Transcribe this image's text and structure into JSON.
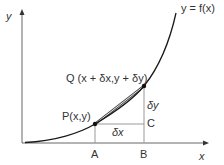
{
  "diagram": {
    "axes": {
      "x_label": "x",
      "y_label": "y"
    },
    "curve_label": "y = f(x)",
    "points": {
      "P": {
        "label": "P(x,y)"
      },
      "Q": {
        "label": "Q (x + δx,y + δy)"
      },
      "A": {
        "label": "A"
      },
      "B": {
        "label": "B"
      },
      "C": {
        "label": "C"
      }
    },
    "increments": {
      "dx": "δx",
      "dy": "δy"
    },
    "colors": {
      "curve": "#1a1a1a",
      "axis": "#555555",
      "guide": "#999999",
      "text": "#333333"
    }
  }
}
